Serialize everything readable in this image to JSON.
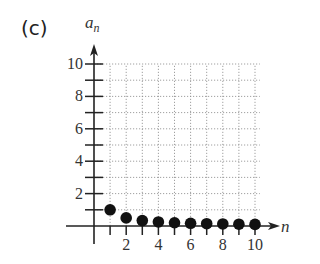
{
  "panel_label": "(c)",
  "chart_data": {
    "type": "scatter",
    "title": "",
    "xlabel": "n",
    "ylabel": "a_n",
    "x": [
      1,
      2,
      3,
      4,
      5,
      6,
      7,
      8,
      9,
      10
    ],
    "series": [
      {
        "name": "a_n = 1/n",
        "values": [
          1.0,
          0.5,
          0.333,
          0.25,
          0.2,
          0.167,
          0.143,
          0.125,
          0.111,
          0.1
        ]
      }
    ],
    "x_ticks": [
      "2",
      "4",
      "6",
      "8",
      "10"
    ],
    "y_ticks": [
      "2",
      "4",
      "6",
      "8",
      "10"
    ],
    "xlim": [
      0,
      10
    ],
    "ylim": [
      0,
      10
    ],
    "grid": true,
    "legend": "none"
  },
  "axis": {
    "x_name": "n",
    "y_name_base": "a",
    "y_name_sub": "n"
  }
}
